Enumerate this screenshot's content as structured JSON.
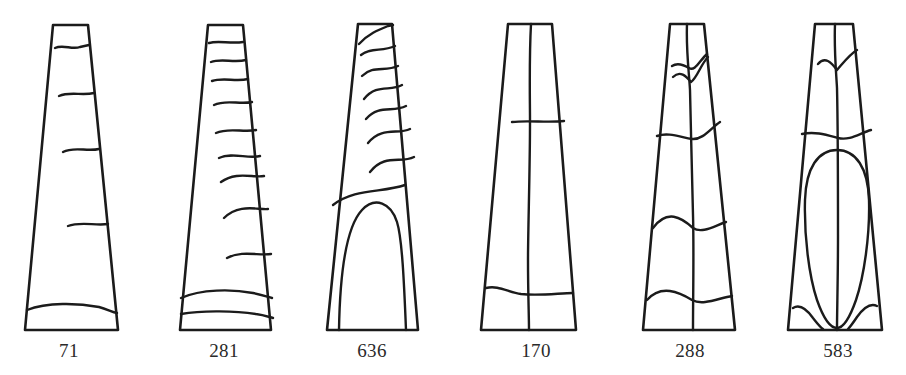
{
  "figure": {
    "background_color": "#ffffff",
    "stroke_color": "#1b1b1b",
    "label_color": "#2a2a2a",
    "count": 6
  },
  "artifacts": [
    {
      "id": "artifact-71",
      "label": "71",
      "label_x": 69,
      "label_y": 340,
      "description": "Tapered wedge with five horizontal banding lines",
      "band_count": 5,
      "pattern": "horizontal-bands"
    },
    {
      "id": "artifact-281",
      "label": "281",
      "label_x": 224,
      "label_y": 340,
      "description": "Tapered wedge with ten closely spaced horizontal bands",
      "band_count": 10,
      "pattern": "horizontal-bands"
    },
    {
      "id": "artifact-636",
      "label": "636",
      "label_x": 372,
      "label_y": 340,
      "description": "Tapered wedge with seven oblique wavy bands above a tall arched motif",
      "band_count": 7,
      "pattern": "oblique-bands-with-arch"
    },
    {
      "id": "artifact-170",
      "label": "170",
      "label_x": 536,
      "label_y": 340,
      "description": "Tapered wedge divided by a central vertical line and two horizontal lines",
      "band_count": 2,
      "pattern": "cross-division"
    },
    {
      "id": "artifact-288",
      "label": "288",
      "label_x": 690,
      "label_y": 340,
      "description": "Tapered wedge with central vertical line and offset irregular cross bands",
      "band_count": 4,
      "pattern": "offset-cross-bands"
    },
    {
      "id": "artifact-583",
      "label": "583",
      "label_x": 838,
      "label_y": 340,
      "description": "Tapered wedge with central vertical line and large elongated oval cartouche",
      "band_count": 2,
      "pattern": "oval-cartouche"
    }
  ]
}
